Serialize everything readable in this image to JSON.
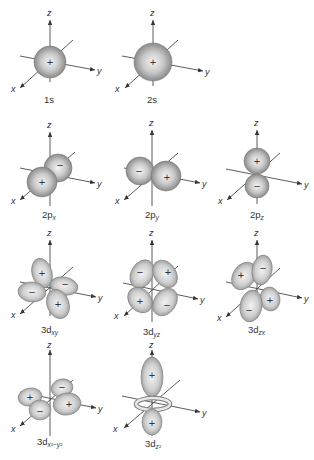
{
  "axes": {
    "x": "x",
    "y": "y",
    "z": "z"
  },
  "orbitals": [
    {
      "id": "1s",
      "label": "1s",
      "sub": "",
      "signs": [
        "+"
      ]
    },
    {
      "id": "2s",
      "label": "2s",
      "sub": "",
      "signs": [
        "+"
      ]
    },
    {
      "id": "2px",
      "label": "2p",
      "sub": "x",
      "signs": [
        "+",
        "−"
      ]
    },
    {
      "id": "2py",
      "label": "2p",
      "sub": "y",
      "signs": [
        "−",
        "+"
      ]
    },
    {
      "id": "2pz",
      "label": "2p",
      "sub": "z",
      "signs": [
        "+",
        "−"
      ]
    },
    {
      "id": "3dxy",
      "label": "3d",
      "sub": "xy",
      "signs": [
        "+",
        "−",
        "−",
        "+"
      ]
    },
    {
      "id": "3dyz",
      "label": "3d",
      "sub": "yz",
      "signs": [
        "−",
        "+",
        "+",
        "−"
      ]
    },
    {
      "id": "3dzx",
      "label": "3d",
      "sub": "zx",
      "signs": [
        "+",
        "−",
        "+",
        "−"
      ]
    },
    {
      "id": "3dx2y2",
      "label": "3d",
      "sub": "x²−y²",
      "signs": [
        "+",
        "−",
        "−",
        "+"
      ]
    },
    {
      "id": "3dz2",
      "label": "3d",
      "sub": "z²",
      "signs": [
        "+",
        "+"
      ]
    }
  ],
  "colors": {
    "lobe_light": "#f2f2f2",
    "lobe_dark": "#8c8c8c",
    "axis": "#4a4a4a",
    "text": "#333333"
  }
}
